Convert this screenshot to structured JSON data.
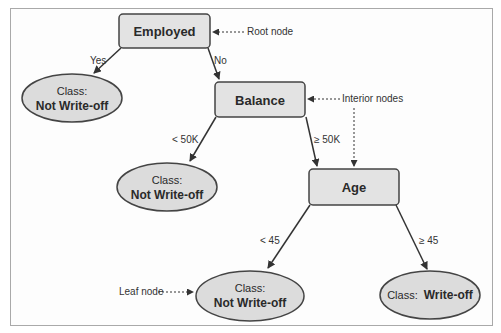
{
  "diagram": {
    "colors": {
      "node_fill": "#e3e3e3",
      "node_stroke": "#444444",
      "edge": "#333333",
      "frame": "#a9a9a9"
    },
    "nodes": {
      "employed": {
        "label": "Employed",
        "type": "root"
      },
      "balance": {
        "label": "Balance",
        "type": "interior"
      },
      "age": {
        "label": "Age",
        "type": "interior"
      },
      "leaf1": {
        "prefix": "Class:",
        "value": "Not Write-off",
        "type": "leaf"
      },
      "leaf2": {
        "prefix": "Class:",
        "value": "Not Write-off",
        "type": "leaf"
      },
      "leaf3": {
        "prefix": "Class:",
        "value": "Not Write-off",
        "type": "leaf"
      },
      "leaf4": {
        "prefix": "Class:",
        "value": "Write-off",
        "type": "leaf"
      }
    },
    "edges": {
      "employed_yes": "Yes",
      "employed_no": "No",
      "balance_lt": "< 50K",
      "balance_ge": "≥ 50K",
      "age_lt": "< 45",
      "age_ge": "≥ 45"
    },
    "callouts": {
      "root": "Root node",
      "interior": "Interior nodes",
      "leaf": "Leaf node"
    }
  }
}
